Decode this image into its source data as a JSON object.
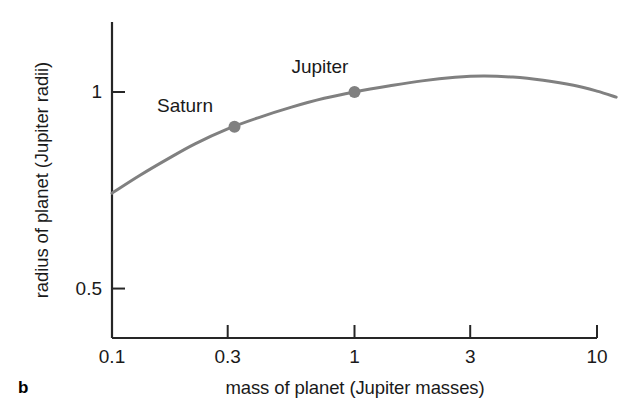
{
  "figure": {
    "panel_letter": "b",
    "line_color": "#808080",
    "axis_color": "#262626",
    "text_color": "#1a1a1a"
  },
  "chart_data": {
    "type": "line",
    "title": "",
    "xlabel": "mass of planet (Jupiter masses)",
    "ylabel": "radius of planet (Jupiter radii)",
    "xscale": "log",
    "yscale": "log",
    "xlim": [
      0.1,
      10
    ],
    "ylim": [
      0.42,
      1.28
    ],
    "grid": false,
    "legend": "none",
    "xticks": [
      0.1,
      0.3,
      1,
      3,
      10
    ],
    "xtick_labels": [
      "0.1",
      "0.3",
      "1",
      "3",
      "10"
    ],
    "yticks": [
      0.5,
      1
    ],
    "ytick_labels": [
      "0.5",
      "1"
    ],
    "series": [
      {
        "name": "mass-radius relation",
        "x": [
          0.1,
          0.13,
          0.17,
          0.22,
          0.3,
          0.4,
          0.55,
          0.75,
          1.0,
          1.4,
          1.9,
          2.6,
          3.4,
          4.5,
          6.0,
          8.0,
          10.0,
          12.0
        ],
        "y": [
          0.7,
          0.745,
          0.79,
          0.833,
          0.878,
          0.913,
          0.948,
          0.978,
          1.0,
          1.022,
          1.04,
          1.053,
          1.058,
          1.054,
          1.042,
          1.024,
          1.003,
          0.982
        ]
      }
    ],
    "points": [
      {
        "label": "Saturn",
        "x": 0.32,
        "y": 0.885
      },
      {
        "label": "Jupiter",
        "x": 1.0,
        "y": 1.0
      }
    ],
    "annotations": [
      {
        "text": "Saturn",
        "x": 0.2,
        "y": 0.945
      },
      {
        "text": "Jupiter",
        "x": 0.72,
        "y": 1.085
      }
    ]
  }
}
